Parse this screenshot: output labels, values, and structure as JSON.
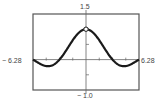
{
  "chart_data": {
    "type": "line",
    "title": "",
    "xlabel": "",
    "ylabel": "",
    "xlim": [
      -6.28,
      6.28
    ],
    "ylim": [
      -1.0,
      1.5
    ],
    "x_tick_labels": [
      "-6.28",
      "6.28"
    ],
    "y_tick_labels": [
      "1.5",
      "-1.0"
    ],
    "x_tick_spacing": 1.5708,
    "y_tick_spacing": 0.5,
    "grid": false,
    "legend": null,
    "series": [
      {
        "name": "f(x) = sin(x)/x",
        "x": [
          -6.28,
          -5.5,
          -4.49,
          -3.5,
          -3.14,
          -2.5,
          -2.0,
          -1.5,
          -1.0,
          -0.5,
          0,
          0.5,
          1.0,
          1.5,
          2.0,
          2.5,
          3.14,
          3.5,
          4.49,
          5.5,
          6.28
        ],
        "values": [
          0.0,
          -0.128,
          -0.217,
          -0.1,
          0.0,
          0.239,
          0.455,
          0.665,
          0.841,
          0.959,
          1.0,
          0.959,
          0.841,
          0.665,
          0.455,
          0.239,
          0.0,
          -0.1,
          -0.217,
          -0.128,
          0.0
        ]
      }
    ],
    "annotations": [
      {
        "type": "open-circle",
        "x": 0,
        "y": 1.0,
        "note": "hole at (0, 1)"
      }
    ]
  },
  "labels": {
    "ymax": "1.5",
    "ymin": "− 1.0",
    "xmin": "− 6.28",
    "xmax": "6.28"
  },
  "colors": {
    "curve": "#1a1a1a",
    "frame": "#555555",
    "axis": "#666666"
  }
}
